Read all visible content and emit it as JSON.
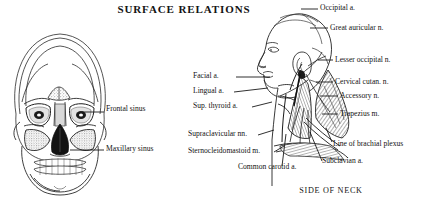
{
  "figure": {
    "title": "SURFACE RELATIONS",
    "caption": "SIDE OF NECK"
  },
  "skull_panel": {
    "name": "anterior-skull-diagram",
    "labels": [
      {
        "text": "Frontal sinus",
        "x": 104,
        "y": 106
      },
      {
        "text": "Maxillary sinus",
        "x": 104,
        "y": 146
      }
    ]
  },
  "neck_panel": {
    "name": "side-of-neck-diagram",
    "left_labels": [
      {
        "text": "Facial a.",
        "x": 193,
        "y": 72
      },
      {
        "text": "Lingual a.",
        "x": 193,
        "y": 87
      },
      {
        "text": "Sup. thyroid a.",
        "x": 193,
        "y": 102
      },
      {
        "text": "Supraclavicular nn.",
        "x": 188,
        "y": 130
      },
      {
        "text": "Sternocleidomastoid m.",
        "x": 188,
        "y": 147
      },
      {
        "text": "Common carotid a.",
        "x": 238,
        "y": 163
      }
    ],
    "right_labels": [
      {
        "text": "Occipital a.",
        "x": 320,
        "y": 4
      },
      {
        "text": "Great auricular n.",
        "x": 330,
        "y": 24
      },
      {
        "text": "Lesser occipital n.",
        "x": 335,
        "y": 56
      },
      {
        "text": "Cervical cutan. n.",
        "x": 335,
        "y": 78
      },
      {
        "text": "Accessory n.",
        "x": 340,
        "y": 92
      },
      {
        "text": "Trapezius m.",
        "x": 340,
        "y": 110
      },
      {
        "text": "Line of brachial plexus",
        "x": 333,
        "y": 140
      },
      {
        "text": "Subclavian a.",
        "x": 322,
        "y": 157
      }
    ]
  },
  "colors": {
    "ink": "#141414",
    "paper": "#ffffff",
    "shade": "#9a9a9a",
    "stipple": "#b5b5b5"
  }
}
